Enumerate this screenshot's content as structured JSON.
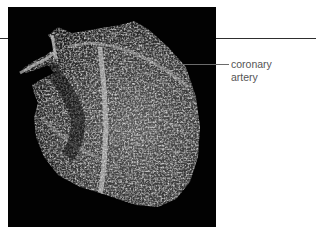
{
  "figure": {
    "background_color": "#020202",
    "label": {
      "line1": "coronary",
      "line2": "artery",
      "color": "#555555"
    },
    "rule_color": "#2e2e2e",
    "leader_color": "#6b6b6b"
  }
}
